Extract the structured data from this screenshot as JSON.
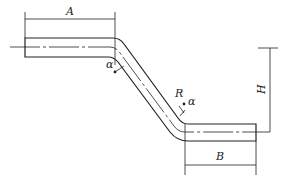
{
  "diagram": {
    "type": "bent bar / pipe offset dimension drawing",
    "labels": {
      "A": "A",
      "B": "B",
      "H": "H",
      "R": "R",
      "alpha_top": "α",
      "alpha_bottom": "α"
    },
    "colors": {
      "line": "#222222",
      "background": "#ffffff"
    }
  }
}
